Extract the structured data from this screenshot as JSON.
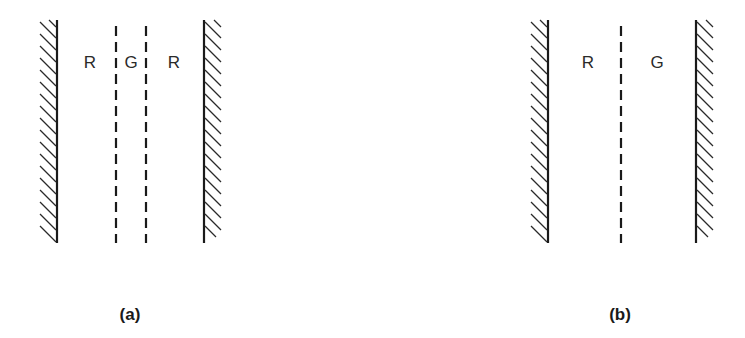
{
  "panels": [
    {
      "caption": "(a)",
      "labels": [
        "R",
        "G",
        "R"
      ],
      "description": "Two hatched walls with two dashed interfaces; region G between R regions"
    },
    {
      "caption": "(b)",
      "labels": [
        "R",
        "G"
      ],
      "description": "Two hatched walls with one dashed interface; region R then region G"
    }
  ],
  "colors": {
    "line": "#1a1a1a",
    "background": "#ffffff"
  }
}
